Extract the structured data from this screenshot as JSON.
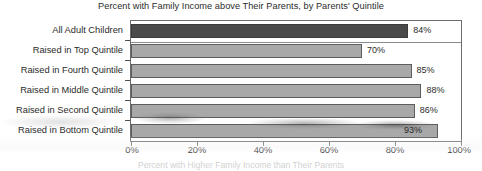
{
  "chart_data": {
    "type": "bar",
    "orientation": "horizontal",
    "title": "Percent with Family Income above Their Parents, by Parents' Quintile",
    "xlabel": "Percent with Higher Family Income than Their Parents",
    "ylabel": "",
    "xlim": [
      0,
      100
    ],
    "grid": false,
    "legend": null,
    "categories": [
      "All Adult Children",
      "Raised in Top Quintile",
      "Raised in Fourth Quintile",
      "Raised in Middle Quintile",
      "Raised in Second Quintile",
      "Raised in Bottom Quintile"
    ],
    "values": [
      84,
      70,
      85,
      88,
      86,
      93
    ],
    "value_labels": [
      "84%",
      "70%",
      "85%",
      "88%",
      "86%",
      "93%"
    ],
    "label_placement": [
      "outside",
      "outside",
      "outside",
      "outside",
      "outside",
      "inside"
    ],
    "xticks": [
      0,
      20,
      40,
      60,
      80,
      100
    ],
    "xtick_labels": [
      "0%",
      "20%",
      "40%",
      "60%",
      "80%",
      "100%"
    ],
    "bar_colors": [
      "#4a4a4a",
      "#a8a8a8",
      "#a8a8a8",
      "#a8a8a8",
      "#a8a8a8",
      "#a8a8a8"
    ],
    "highlight_index": 0
  },
  "colors": {
    "bar_fill": "#a8a8a8",
    "bar_fill_highlight": "#4a4a4a",
    "bar_stroke": "#5d5d5d",
    "axis": "#6b6b6b",
    "text": "#2b2b2b",
    "background": "#ffffff"
  }
}
